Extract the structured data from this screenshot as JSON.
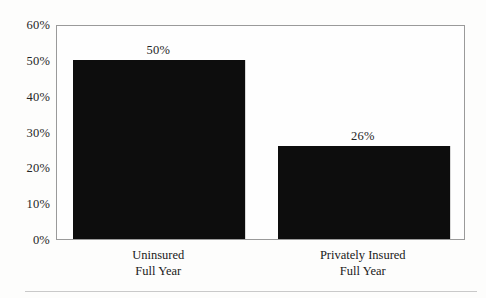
{
  "chart_data": {
    "type": "bar",
    "title": "",
    "subtitle": "",
    "xlabel": "",
    "ylabel": "",
    "categories": [
      "Uninsured Full Year",
      "Privately Insured Full Year"
    ],
    "category_lines": [
      {
        "line1": "Uninsured",
        "line2": "Full Year"
      },
      {
        "line1": "Privately Insured",
        "line2": "Full Year"
      }
    ],
    "values": [
      50,
      26
    ],
    "value_labels": [
      "50%",
      "26%"
    ],
    "ylim": [
      0,
      60
    ],
    "ytick_values": [
      0,
      10,
      20,
      30,
      40,
      50,
      60
    ],
    "ytick_labels": [
      "0%",
      "10%",
      "20%",
      "30%",
      "40%",
      "50%",
      "60%"
    ],
    "grid": false,
    "legend": null,
    "legend_position": "none",
    "bar_color": "#0d0d0d",
    "frame_color": "#9a9a9a",
    "background_color": "#fdfdfc",
    "text_color": "#252525"
  }
}
